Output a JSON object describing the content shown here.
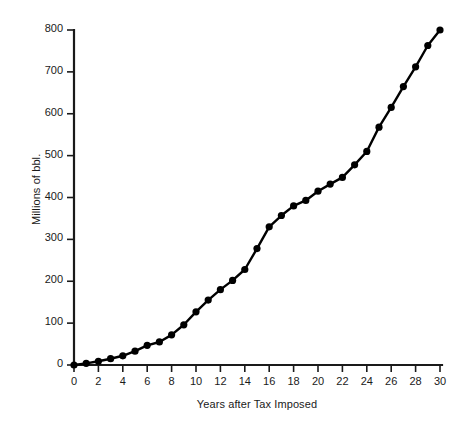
{
  "chart_data": {
    "type": "line",
    "title": "",
    "subtitle": "",
    "xlabel": "Years after Tax Imposed",
    "ylabel": "Millions of bbl.",
    "xlim": [
      0,
      30
    ],
    "ylim": [
      0,
      800
    ],
    "xticks": [
      0,
      2,
      4,
      6,
      8,
      10,
      12,
      14,
      16,
      18,
      20,
      22,
      24,
      26,
      28,
      30
    ],
    "yticks": [
      0,
      100,
      200,
      300,
      400,
      500,
      600,
      700,
      800
    ],
    "xtick_labels": [
      "0",
      "2",
      "4",
      "6",
      "8",
      "10",
      "12",
      "14",
      "16",
      "18",
      "20",
      "22",
      "24",
      "26",
      "28",
      "30"
    ],
    "ytick_labels": [
      "0",
      "100",
      "200",
      "300",
      "400",
      "500",
      "600",
      "700",
      "800"
    ],
    "grid": false,
    "legend": null,
    "legend_position": "none",
    "marker": "filled-circle",
    "line_color": "#000000",
    "marker_color": "#000000",
    "background_color": "#ffffff",
    "axis_color": "#1a1a1a",
    "x": [
      0,
      1,
      2,
      3,
      4,
      5,
      6,
      7,
      8,
      9,
      10,
      11,
      12,
      13,
      14,
      15,
      16,
      17,
      18,
      19,
      20,
      21,
      22,
      23,
      24,
      25,
      26,
      27,
      28,
      29,
      30
    ],
    "values": [
      0,
      4,
      9,
      15,
      22,
      33,
      47,
      55,
      72,
      96,
      127,
      155,
      180,
      202,
      228,
      278,
      330,
      357,
      380,
      393,
      415,
      432,
      448,
      478,
      510,
      568,
      615,
      665,
      712,
      763,
      800
    ],
    "series": [
      {
        "name": "Cumulative production",
        "values": [
          0,
          4,
          9,
          15,
          22,
          33,
          47,
          55,
          72,
          96,
          127,
          155,
          180,
          202,
          228,
          278,
          330,
          357,
          380,
          393,
          415,
          432,
          448,
          478,
          510,
          568,
          615,
          665,
          712,
          763,
          800
        ]
      }
    ],
    "annotations": []
  }
}
